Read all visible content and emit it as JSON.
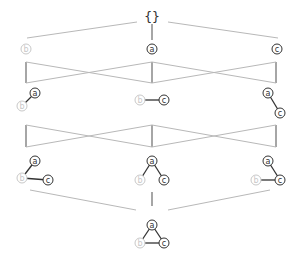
{
  "diagram": {
    "top_label": "{}",
    "colors": {
      "lattice_line": "#b8b8b8",
      "lattice_vertical": "#888888",
      "edge": "#333333",
      "active_node": "#333333",
      "faded_node": "#c8c8c8"
    },
    "levels": [
      {
        "name": "empty",
        "items": [
          {
            "id": "empty-set",
            "label": "{}"
          }
        ]
      },
      {
        "name": "single-vertex",
        "items": [
          {
            "id": "b",
            "nodes": [
              {
                "label": "b",
                "faded": true
              }
            ]
          },
          {
            "id": "a",
            "nodes": [
              {
                "label": "a",
                "faded": false
              }
            ]
          },
          {
            "id": "c",
            "nodes": [
              {
                "label": "c",
                "faded": false
              }
            ]
          }
        ]
      },
      {
        "name": "one-edge",
        "items": [
          {
            "id": "ab",
            "nodes": [
              {
                "label": "a",
                "faded": false
              },
              {
                "label": "b",
                "faded": true
              }
            ],
            "edges": [
              [
                "a",
                "b"
              ]
            ]
          },
          {
            "id": "bc",
            "nodes": [
              {
                "label": "b",
                "faded": true
              },
              {
                "label": "c",
                "faded": false
              }
            ],
            "edges": [
              [
                "b",
                "c"
              ]
            ]
          },
          {
            "id": "ac",
            "nodes": [
              {
                "label": "a",
                "faded": false
              },
              {
                "label": "c",
                "faded": false
              }
            ],
            "edges": [
              [
                "a",
                "c"
              ]
            ]
          }
        ]
      },
      {
        "name": "two-edges",
        "items": [
          {
            "id": "ab-bc",
            "nodes": [
              {
                "label": "a"
              },
              {
                "label": "b",
                "faded": true
              },
              {
                "label": "c"
              }
            ],
            "edges": [
              [
                "a",
                "b"
              ],
              [
                "b",
                "c"
              ]
            ]
          },
          {
            "id": "ab-ac",
            "nodes": [
              {
                "label": "a"
              },
              {
                "label": "b",
                "faded": true
              },
              {
                "label": "c"
              }
            ],
            "edges": [
              [
                "a",
                "b"
              ],
              [
                "a",
                "c"
              ]
            ]
          },
          {
            "id": "ac-bc",
            "nodes": [
              {
                "label": "a"
              },
              {
                "label": "b",
                "faded": true
              },
              {
                "label": "c"
              }
            ],
            "edges": [
              [
                "a",
                "c"
              ],
              [
                "b",
                "c"
              ]
            ]
          }
        ]
      },
      {
        "name": "triangle",
        "items": [
          {
            "id": "abc",
            "nodes": [
              {
                "label": "a"
              },
              {
                "label": "b",
                "faded": true
              },
              {
                "label": "c"
              }
            ],
            "edges": [
              [
                "a",
                "b"
              ],
              [
                "a",
                "c"
              ],
              [
                "b",
                "c"
              ]
            ]
          }
        ]
      }
    ],
    "labels": {
      "a": "a",
      "b": "b",
      "c": "c"
    }
  }
}
